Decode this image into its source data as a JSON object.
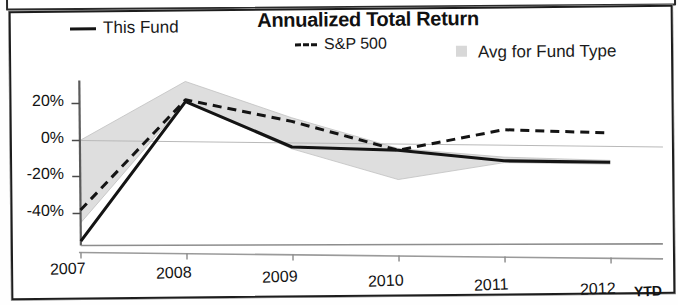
{
  "panel": {
    "border_color": "#1d1d1d",
    "background": "#ffffff"
  },
  "chart_data": {
    "type": "line",
    "title": "Annualized Total Return",
    "xlabel": "",
    "ylabel": "",
    "x": [
      "2007",
      "2008",
      "2009",
      "2010",
      "2011",
      "2012"
    ],
    "categories": [
      "2007",
      "2008",
      "2009",
      "2010",
      "2011",
      "2012"
    ],
    "x_tick_labels": [
      "2007",
      "2008",
      "2009",
      "2010",
      "2011",
      "2012"
    ],
    "x_axis_note": "YTD",
    "y_tick_labels": [
      "20%",
      "0%",
      "-20%",
      "-40%"
    ],
    "y_ticks": [
      20,
      0,
      -20,
      -40
    ],
    "ylim": [
      -58,
      36
    ],
    "grid": false,
    "zero_line": true,
    "legend_position": "top",
    "series": [
      {
        "name": "This Fund",
        "style": "solid",
        "color": "#141414",
        "values": [
          -55,
          22,
          -2,
          -3,
          -8,
          -8
        ]
      },
      {
        "name": "S&P 500",
        "style": "dashed",
        "color": "#141414",
        "values": [
          -38,
          23,
          12,
          -3,
          9,
          8
        ]
      },
      {
        "name": "Avg for Fund Type",
        "style": "band",
        "color": "#d8d8d8",
        "upper": [
          0,
          33,
          14,
          -2,
          -6,
          -7
        ],
        "lower": [
          -45,
          22,
          -3,
          -19,
          -9,
          -9
        ]
      }
    ],
    "annotations": []
  },
  "legend": {
    "this_fund": "This Fund",
    "sp500": "S&P 500",
    "avg_fund_type": "Avg for Fund Type"
  },
  "axis": {
    "y": {
      "t0": "20%",
      "t1": "0%",
      "t2": "-20%",
      "t3": "-40%"
    },
    "x": {
      "y2007": "2007",
      "y2008": "2008",
      "y2009": "2009",
      "y2010": "2010",
      "y2011": "2011",
      "y2012": "2012",
      "ytd": "YTD"
    }
  }
}
